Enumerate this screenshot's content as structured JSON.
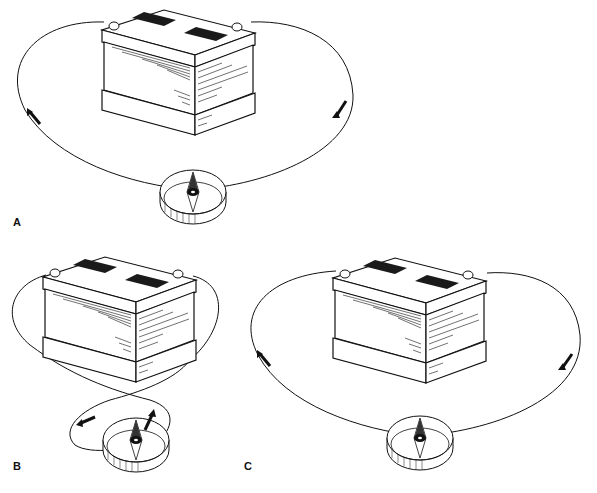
{
  "figure": {
    "panels": [
      {
        "id": "A",
        "label": "A",
        "wire": "single loop over compass",
        "arrows": [
          "counter-clockwise left",
          "clockwise right"
        ]
      },
      {
        "id": "B",
        "label": "B",
        "wire": "crossed loop, coil around compass",
        "arrows": [
          "left",
          "up"
        ]
      },
      {
        "id": "C",
        "label": "C",
        "wire": "single loop over compass",
        "arrows": [
          "counter-clockwise left",
          "clockwise right"
        ]
      }
    ]
  },
  "colors": {
    "ink": "#111111",
    "background": "#ffffff",
    "plate": "#1a1a1a"
  }
}
